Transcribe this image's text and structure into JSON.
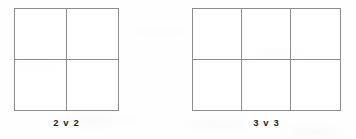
{
  "page": {
    "background_color": "#fefefe",
    "width": 356,
    "height": 139
  },
  "style": {
    "line_color": "#8c8c8c",
    "text_color": "#1f1f1f",
    "cell_fill": "#ffffff"
  },
  "figures": [
    {
      "id": "2v2",
      "caption": "2 v 2",
      "columns": 2,
      "rows": 2,
      "cell_count": 4
    },
    {
      "id": "3v3",
      "caption": "3 v 3",
      "columns": 3,
      "rows": 2,
      "cell_count": 6
    }
  ]
}
